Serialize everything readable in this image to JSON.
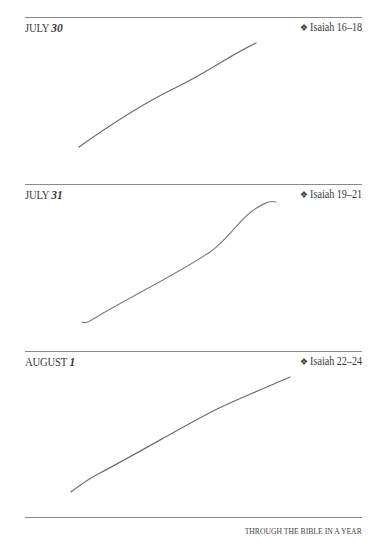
{
  "entries": [
    {
      "month": "JULY",
      "day": "30",
      "ornament": "❖",
      "reading": "Isaiah 16–18"
    },
    {
      "month": "JULY",
      "day": "31",
      "ornament": "❖",
      "reading": "Isaiah 19–21"
    },
    {
      "month": "AUGUST",
      "day": "1",
      "ornament": "❖",
      "reading": "Isaiah 22–24"
    }
  ],
  "footer": {
    "text": "THROUGH THE BIBLE IN A YEAR"
  },
  "colors": {
    "rule": "#8a8a8a",
    "ink": "#3a3a3a",
    "pencil": "#555555"
  }
}
